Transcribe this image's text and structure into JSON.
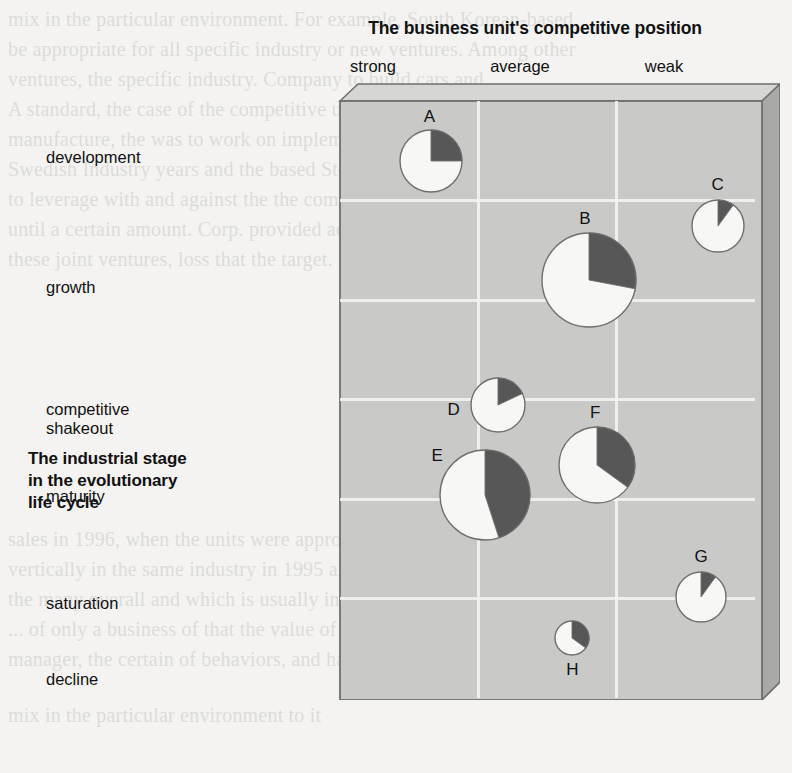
{
  "column_axis_title": "The business unit's competitive position",
  "row_axis_title_lines": [
    "The industrial stage",
    "in the evolutionary",
    "life cycle"
  ],
  "columns": [
    {
      "key": "strong",
      "label": "strong"
    },
    {
      "key": "average",
      "label": "average"
    },
    {
      "key": "weak",
      "label": "weak"
    }
  ],
  "rows": [
    {
      "key": "development",
      "lines": [
        "development"
      ]
    },
    {
      "key": "growth",
      "lines": [
        "growth"
      ]
    },
    {
      "key": "competitive_shakeout",
      "lines": [
        "competitive",
        "shakeout"
      ]
    },
    {
      "key": "maturity",
      "lines": [
        "maturity"
      ]
    },
    {
      "key": "saturation",
      "lines": [
        "saturation"
      ]
    },
    {
      "key": "decline",
      "lines": [
        "decline"
      ]
    }
  ],
  "colors": {
    "slab_front": "#c9c9c7",
    "slab_top": "#d6d6d4",
    "slab_side": "#a9a9a7",
    "slab_outline": "#6f6f6d",
    "gridline": "#f2f2f0",
    "pie_light": "#f7f7f5",
    "pie_dark": "#575757",
    "pie_outline": "#6f6f6d",
    "text": "#111111",
    "page_background": "#f4f3f1"
  },
  "chart_data": {
    "type": "scatter",
    "xlabel": "The business unit's competitive position",
    "ylabel": "The industrial stage in the evolutionary life cycle",
    "x_categories": [
      "strong",
      "average",
      "weak"
    ],
    "y_categories": [
      "development",
      "growth",
      "competitive shakeout",
      "maturity",
      "saturation",
      "decline"
    ],
    "grid": true,
    "legend": "none",
    "marker": "pie-bubble",
    "encoding": {
      "x": "competitive position (categorical, 3 columns)",
      "y": "life-cycle stage (categorical, 6 rows)",
      "size": "relative business unit size",
      "pie_dark_share": "shaded share of the bubble"
    },
    "points": [
      {
        "label": "A",
        "x_category": "strong",
        "y_category": "development",
        "x_pct": 22,
        "y_pct": 10,
        "radius_px": 31,
        "dark_share_pct": 25,
        "label_dx": -2,
        "label_dy": -44
      },
      {
        "label": "B",
        "x_category": "average",
        "y_category": "growth",
        "x_pct": 60,
        "y_pct": 30,
        "radius_px": 47,
        "dark_share_pct": 28,
        "label_dx": -4,
        "label_dy": -61
      },
      {
        "label": "C",
        "x_category": "weak",
        "y_category": "growth",
        "x_pct": 91,
        "y_pct": 21,
        "radius_px": 26,
        "dark_share_pct": 10,
        "label_dx": 0,
        "label_dy": -41
      },
      {
        "label": "D",
        "x_category": "strong",
        "y_category": "competitive shakeout",
        "x_pct": 38,
        "y_pct": 51,
        "radius_px": 27,
        "dark_share_pct": 18,
        "label_dx": -44,
        "label_dy": 5
      },
      {
        "label": "E",
        "x_category": "strong",
        "y_category": "maturity",
        "x_pct": 35,
        "y_pct": 66,
        "radius_px": 45,
        "dark_share_pct": 45,
        "label_dx": -48,
        "label_dy": -39
      },
      {
        "label": "F",
        "x_category": "average",
        "y_category": "maturity",
        "x_pct": 62,
        "y_pct": 61,
        "radius_px": 38,
        "dark_share_pct": 35,
        "label_dx": -2,
        "label_dy": -52
      },
      {
        "label": "G",
        "x_category": "weak",
        "y_category": "saturation",
        "x_pct": 87,
        "y_pct": 83,
        "radius_px": 25,
        "dark_share_pct": 10,
        "label_dx": 0,
        "label_dy": -40
      },
      {
        "label": "H",
        "x_category": "average",
        "y_category": "saturation",
        "x_pct": 56,
        "y_pct": 90,
        "radius_px": 17,
        "dark_share_pct": 35,
        "label_dx": 0,
        "label_dy": 32
      }
    ]
  }
}
